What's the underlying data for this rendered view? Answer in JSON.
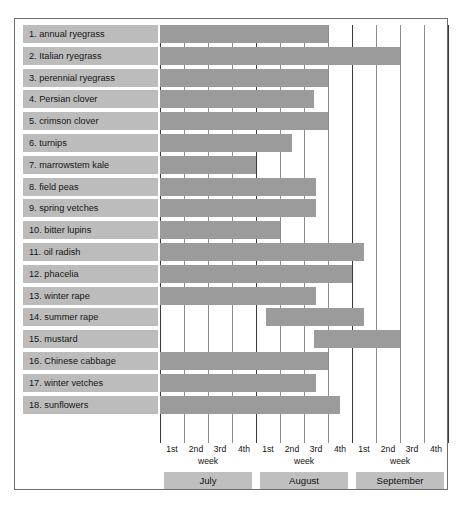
{
  "chart_data": {
    "type": "bar",
    "title": "",
    "xlabel": "week",
    "ylabel": "",
    "orientation": "horizontal",
    "grid": true,
    "legend": false,
    "axis": {
      "months": [
        "July",
        "August",
        "September"
      ],
      "week_labels": [
        "1st",
        "2nd",
        "3rd",
        "4th"
      ],
      "week_word": "week",
      "columns": 12,
      "xlim": [
        0,
        12
      ]
    },
    "categories": [
      "1. annual ryegrass",
      "2. Italian ryegrass",
      "3. perennial ryegrass",
      "4. Persian clover",
      "5. crimson clover",
      "6. turnips",
      "7. marrowstem kale",
      "8. field peas",
      "9. spring vetches",
      "10. bitter lupins",
      "11. oil radish",
      "12. phacelia",
      "13. winter rape",
      "14. summer rape",
      "15. mustard",
      "16. Chinese cabbage",
      "17. winter vetches",
      "18. sunflowers"
    ],
    "bars": [
      {
        "label": "1. annual ryegrass",
        "start": 0,
        "end": 7
      },
      {
        "label": "2. Italian ryegrass",
        "start": 0,
        "end": 10
      },
      {
        "label": "3. perennial ryegrass",
        "start": 0,
        "end": 7
      },
      {
        "label": "4. Persian clover",
        "start": 0,
        "end": 6.4
      },
      {
        "label": "5. crimson clover",
        "start": 0,
        "end": 7
      },
      {
        "label": "6. turnips",
        "start": 0,
        "end": 5.5
      },
      {
        "label": "7. marrowstem kale",
        "start": 0,
        "end": 4
      },
      {
        "label": "8. field peas",
        "start": 0,
        "end": 6.5
      },
      {
        "label": "9. spring vetches",
        "start": 0,
        "end": 6.5
      },
      {
        "label": "10. bitter lupins",
        "start": 0,
        "end": 5
      },
      {
        "label": "11. oil radish",
        "start": 0,
        "end": 8.5
      },
      {
        "label": "12. phacelia",
        "start": 0,
        "end": 8
      },
      {
        "label": "13. winter rape",
        "start": 0,
        "end": 6.5
      },
      {
        "label": "14. summer rape",
        "start": 4.4,
        "end": 8.5
      },
      {
        "label": "15. mustard",
        "start": 6.4,
        "end": 10
      },
      {
        "label": "16. Chinese cabbage",
        "start": 0,
        "end": 7
      },
      {
        "label": "17. winter vetches",
        "start": 0,
        "end": 6.5
      },
      {
        "label": "18. sunflowers",
        "start": 0,
        "end": 7.5
      }
    ],
    "colors": {
      "bar": "#9b9b9b",
      "label_box": "#bcbcbc",
      "month_box": "#bfbfbf",
      "gridline": "#8d8d8d",
      "gridline_major": "#3a3a3a",
      "frame": "#6f6f6f",
      "background": "#ffffff"
    }
  }
}
